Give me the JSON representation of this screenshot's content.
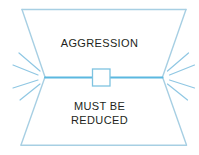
{
  "diagram": {
    "type": "hourglass-concept-diagram",
    "background_color": "#ffffff",
    "outline_color": "#a7cfe3",
    "divider_color": "#5bb8e0",
    "ray_color": "#8fc7e3",
    "text_color": "#231f20",
    "top_section": {
      "label": "AGGRESSION"
    },
    "bottom_section": {
      "label": "MUST BE\nREDUCED"
    },
    "center_node": {
      "name": "square-node",
      "shape": "square"
    },
    "left_burst": {
      "name": "left-starburst",
      "ray_count": 4
    },
    "right_burst": {
      "name": "right-starburst",
      "ray_count": 4
    }
  }
}
